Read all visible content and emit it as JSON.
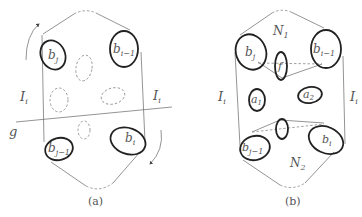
{
  "figure": {
    "panels": [
      {
        "id": "a",
        "caption": "(a)",
        "labels": {
          "top_left": "b",
          "top_left_sub": "j",
          "top_right": "b",
          "top_right_sub": "i−1",
          "bottom_left": "b",
          "bottom_left_sub": "j−1",
          "bottom_right": "b",
          "bottom_right_sub": "i",
          "left_side": "I",
          "left_side_sub": "i",
          "right_side": "I",
          "right_side_sub": "i",
          "line_label": "g"
        }
      },
      {
        "id": "b",
        "caption": "(b)",
        "labels": {
          "top_region": "N",
          "top_region_sub": "1",
          "bottom_region": "N",
          "bottom_region_sub": "2",
          "top_left": "b",
          "top_left_sub": "j",
          "top_right": "b",
          "top_right_sub": "i−1",
          "bottom_left": "b",
          "bottom_left_sub": "j−1",
          "bottom_right": "b",
          "bottom_right_sub": "i",
          "center_ellipse": "f",
          "left_inner": "a",
          "left_inner_sub": "1",
          "right_inner": "a",
          "right_inner_sub": "2",
          "left_side": "I",
          "left_side_sub": "i",
          "right_side": "I",
          "right_side_sub": "i"
        }
      }
    ]
  }
}
